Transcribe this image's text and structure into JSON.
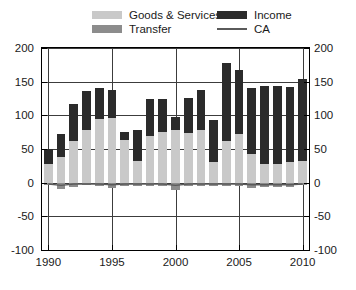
{
  "legend": {
    "items": [
      {
        "label": "Goods & Services",
        "color": "#c9c9c9",
        "marker": "swatch"
      },
      {
        "label": "Transfer",
        "color": "#8c8c8c",
        "marker": "swatch"
      },
      {
        "label": "Income",
        "color": "#2b2b2b",
        "marker": "swatch"
      },
      {
        "label": "CA",
        "color": "#5a5a5a",
        "marker": "line"
      }
    ]
  },
  "axes": {
    "y_left_ticks": [
      "200",
      "150",
      "100",
      "50",
      "0",
      "-50",
      "-100"
    ],
    "y_right_ticks": [
      "200",
      "150",
      "100",
      "50",
      "0",
      "-50",
      "-100"
    ],
    "x_ticks": [
      "1990",
      "1995",
      "2000",
      "2005",
      "2010"
    ]
  },
  "chart_data": {
    "type": "bar",
    "title": "",
    "subtitle": "",
    "xlabel": "",
    "ylabel": "",
    "stacked": true,
    "grid": true,
    "legend_position": "top",
    "ylim": [
      -100,
      200
    ],
    "yticks": [
      -100,
      -50,
      0,
      50,
      100,
      150,
      200
    ],
    "xticks": [
      1990,
      1995,
      2000,
      2005,
      2010
    ],
    "categories": [
      "1990",
      "1991",
      "1992",
      "1993",
      "1994",
      "1995",
      "1996",
      "1997",
      "1998",
      "1999",
      "2000",
      "2001",
      "2002",
      "2003",
      "2004",
      "2005",
      "2006",
      "2007",
      "2008",
      "2009",
      "2010"
    ],
    "series": [
      {
        "name": "Goods & Services",
        "color": "#c9c9c9",
        "values": [
          28,
          38,
          62,
          78,
          95,
          96,
          63,
          32,
          70,
          75,
          78,
          74,
          78,
          30,
          62,
          72,
          42,
          28,
          28,
          30,
          32
        ]
      },
      {
        "name": "Income",
        "color": "#2b2b2b",
        "values": [
          22,
          34,
          55,
          58,
          45,
          41,
          12,
          46,
          55,
          50,
          20,
          52,
          59,
          63,
          116,
          96,
          98,
          116,
          116,
          112,
          122
        ]
      },
      {
        "name": "Transfer",
        "color": "#8c8c8c",
        "values": [
          -4,
          -9,
          -6,
          -4,
          -5,
          -8,
          -5,
          -5,
          -5,
          -5,
          -11,
          -5,
          -5,
          -5,
          -5,
          -5,
          -8,
          -7,
          -7,
          -7,
          -4
        ]
      }
    ],
    "line_series": [
      {
        "name": "CA",
        "color": "#5a5a5a",
        "values": [
          -2,
          -4,
          -2,
          -2,
          -2,
          -3,
          -2,
          -2,
          -2,
          -2,
          -4,
          -2,
          -2,
          -2,
          -2,
          -2,
          -3,
          -3,
          -3,
          -3,
          -2
        ]
      }
    ]
  }
}
